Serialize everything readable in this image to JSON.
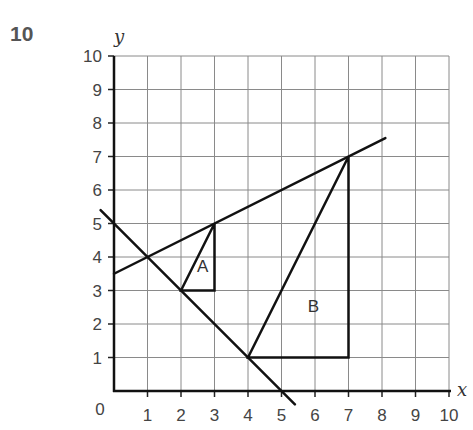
{
  "question_number": "10",
  "chart_data": {
    "type": "line",
    "title": "",
    "xlabel": "x",
    "ylabel": "y",
    "xlim": [
      0,
      10
    ],
    "ylim": [
      0,
      10
    ],
    "grid": true,
    "x_ticks": [
      "1",
      "2",
      "3",
      "4",
      "5",
      "6",
      "7",
      "8",
      "9",
      "10"
    ],
    "y_ticks": [
      "1",
      "2",
      "3",
      "4",
      "5",
      "6",
      "7",
      "8",
      "9",
      "10"
    ],
    "origin_label": "0",
    "lines": [
      {
        "name": "line-1",
        "equation": "y = 0.5x + 3.5",
        "from": [
          0,
          3.5
        ],
        "to": [
          8.1,
          7.55
        ]
      },
      {
        "name": "line-2",
        "equation": "y = 5 - x",
        "from": [
          -0.4,
          5.4
        ],
        "to": [
          5.4,
          -0.4
        ]
      }
    ],
    "shapes": [
      {
        "label": "A",
        "vertices": [
          [
            2,
            3
          ],
          [
            3,
            5
          ],
          [
            3,
            3
          ]
        ],
        "label_pos": [
          2.65,
          3.55
        ]
      },
      {
        "label": "B",
        "vertices": [
          [
            4,
            1
          ],
          [
            7,
            7
          ],
          [
            7,
            1
          ]
        ],
        "label_pos": [
          5.95,
          2.35
        ]
      }
    ]
  }
}
